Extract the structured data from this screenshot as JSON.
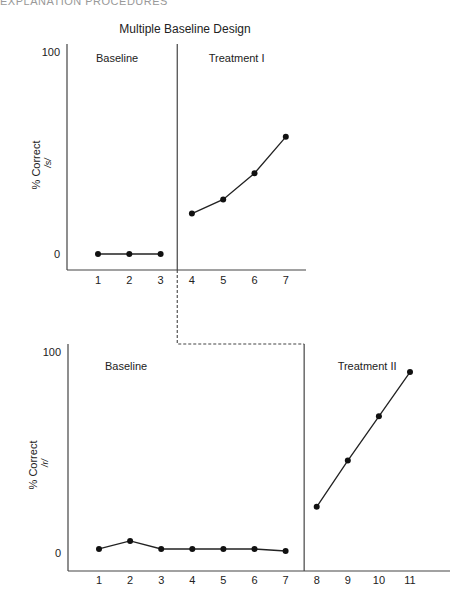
{
  "header": {
    "running_head": "EXPLANATION PROCEDURES"
  },
  "chart_data": [
    {
      "type": "line",
      "title": "Multiple Baseline Design",
      "ylabel": "% Correct",
      "ylabel_sub": "/s/",
      "xlabel": "",
      "ylim": [
        0,
        100
      ],
      "yticks": [
        0,
        100
      ],
      "categories": [
        "1",
        "2",
        "3",
        "4",
        "5",
        "6",
        "7"
      ],
      "phases": [
        {
          "name": "Baseline",
          "x": [
            1,
            2,
            3
          ],
          "values": [
            0,
            0,
            0
          ]
        },
        {
          "name": "Treatment I",
          "x": [
            4,
            5,
            6,
            7
          ],
          "values": [
            20,
            27,
            40,
            58
          ]
        }
      ],
      "phase_change_after": 3.5,
      "grid": false,
      "legend": "none"
    },
    {
      "type": "line",
      "title": "",
      "ylabel": "% Correct",
      "ylabel_sub": "/r/",
      "xlabel": "",
      "ylim": [
        0,
        100
      ],
      "yticks": [
        0,
        100
      ],
      "categories": [
        "1",
        "2",
        "3",
        "4",
        "5",
        "6",
        "7",
        "8",
        "9",
        "10",
        "11"
      ],
      "phases": [
        {
          "name": "Baseline",
          "x": [
            1,
            2,
            3,
            4,
            5,
            6,
            7
          ],
          "values": [
            2,
            6,
            2,
            2,
            2,
            2,
            1
          ]
        },
        {
          "name": "Treatment II",
          "x": [
            8,
            9,
            10,
            11
          ],
          "values": [
            23,
            46,
            68,
            90
          ]
        }
      ],
      "phase_change_after": 7.5,
      "grid": false,
      "legend": "none"
    }
  ],
  "connector": {
    "style": "dashed",
    "from_phase_line": "top",
    "to_phase_line": "bottom"
  }
}
